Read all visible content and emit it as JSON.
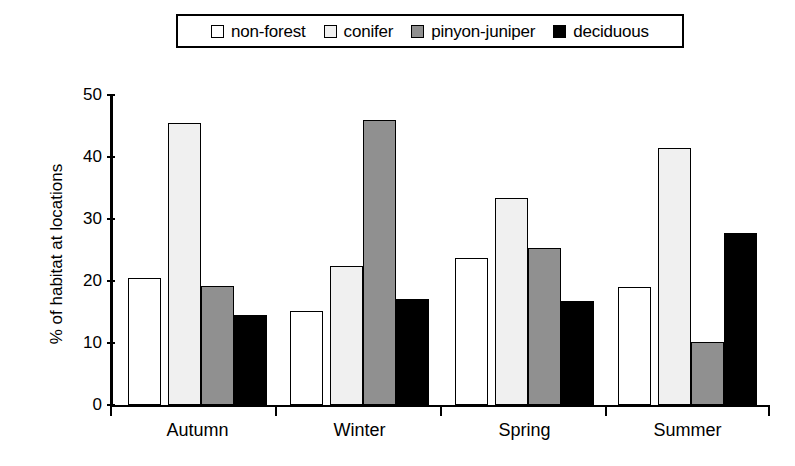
{
  "chart_data": {
    "type": "bar",
    "title": "",
    "xlabel": "",
    "ylabel": "% of habitat at locations",
    "ylim": [
      0,
      50
    ],
    "yticks": [
      0,
      10,
      20,
      30,
      40,
      50
    ],
    "grid": false,
    "legend_position": "top",
    "categories": [
      "Autumn",
      "Winter",
      "Spring",
      "Summer"
    ],
    "series": [
      {
        "name": "non-forest",
        "color": "#ffffff",
        "values": [
          20.5,
          15.1,
          23.7,
          19.0
        ]
      },
      {
        "name": "conifer",
        "color": "#f0f0f0",
        "values": [
          45.5,
          22.4,
          33.4,
          41.5
        ]
      },
      {
        "name": "pinyon-juniper",
        "color": "#909090",
        "values": [
          19.2,
          46.0,
          25.3,
          10.2
        ]
      },
      {
        "name": "deciduous",
        "color": "#000000",
        "values": [
          14.5,
          17.1,
          16.7,
          27.8
        ]
      }
    ]
  },
  "legend": {
    "entries": [
      {
        "label": "non-forest",
        "color": "#ffffff"
      },
      {
        "label": "conifer",
        "color": "#f0f0f0"
      },
      {
        "label": "pinyon-juniper",
        "color": "#909090"
      },
      {
        "label": "deciduous",
        "color": "#000000"
      }
    ]
  },
  "axes": {
    "y_title": "% of habitat at locations",
    "y_tick_labels": [
      "50",
      "40",
      "30",
      "20",
      "10",
      "0"
    ],
    "x_tick_labels": [
      "Autumn",
      "Winter",
      "Spring",
      "Summer"
    ]
  }
}
